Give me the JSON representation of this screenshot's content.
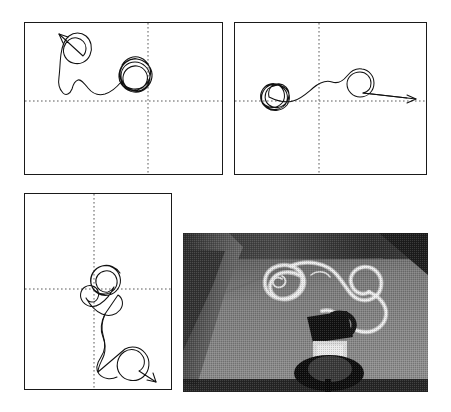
{
  "figure": {
    "background_color": "#ffffff",
    "width": 451,
    "height": 412,
    "panel_border_color": "#1a1a1a",
    "trace_color": "#111111",
    "axis_color": "#5a5a5a"
  },
  "panels": [
    {
      "id": "panel-top-left",
      "label": "",
      "x": 24,
      "y": 22,
      "width": 199,
      "height": 153,
      "origin_x": 0.625,
      "origin_y": 0.515,
      "axes_style": "dotted-crosshair",
      "trajectory": {
        "description": "looping path starting lower-right cluster of loops, exiting upper-left with arrow",
        "start_point": [
          0.63,
          0.53
        ],
        "end_point": [
          0.275,
          0.155
        ],
        "arrow_direction": "upper-left",
        "loop_count": 6,
        "path": "M 134 94 C 140 88 150 86 157 92 C 164 98 164 110 157 116 C 150 122 139 120 134 113 C 129 106 131 96 139 92 C 147 88 157 92 160 100 C 163 108 158 117 150 119 C 142 121 134 115 133 107 C 132 98 139 91 147 91 C 155 91 161 98 161 106 C 161 114 154 121 146 121 C 138 121 132 114 132 106 C 132 99 137 93 144 92 C 151 91 158 96 159 103 C 160 111 154 117 147 117 C 140 117 135 111 136 104 C 137 98 142 94 148 95 C 154 96 158 102 156 108 L 150 118 C 146 124 139 126 133 123 C 127 120 124 113 126 107 C 120 104 114 99 108 97 C 100 95 94 99 90 105 C 86 111 83 110 80 104 C 78 98 79 92 80 86 C 81 78 80 70 79 63 C 78 55 77 48 78 41 C 79 35 82 30 87 28 C 92 26 97 28 100 32 C 103 36 103 41 100 45 C 97 49 92 50 88 47 C 84 44 83 39 86 35 C 89 31 94 30 97 33 L 70 20"
      }
    },
    {
      "id": "panel-top-right",
      "label": "",
      "x": 234,
      "y": 22,
      "width": 193,
      "height": 153,
      "origin_x": 0.44,
      "origin_y": 0.515,
      "axes_style": "dotted-crosshair",
      "trajectory": {
        "description": "dense loop cluster near origin, path travels right ending in a circle with arrow pointing right",
        "start_point": [
          0.22,
          0.5
        ],
        "end_point": [
          0.99,
          0.51
        ],
        "arrow_direction": "right",
        "loop_count": 6,
        "path": "M 42 68 C 36 70 33 76 35 82 C 37 88 44 91 50 88 C 56 85 58 78 55 72 C 52 66 45 63 39 66 C 33 69 30 77 34 83 C 38 90 46 92 53 89 C 60 86 63 78 60 71 C 57 64 49 61 42 64 C 35 67 31 76 35 83 C 39 90 48 92 55 88 C 62 84 64 75 60 68 C 56 62 48 60 42 63 C 38 66 36 71 37 76 C 39 83 46 87 53 85 C 60 83 64 76 62 69 C 60 63 54 59 48 60 C 44 61 41 64 40 68 C 50 72 60 76 66 74 C 74 72 80 66 86 60 C 92 54 99 51 106 54 C 112 57 116 52 120 47 C 124 42 129 40 134 42 C 139 44 141 50 139 55 C 137 60 132 63 127 62 C 122 61 119 56 121 51 C 123 47 128 45 132 47 C 136 49 137 54 134 57 L 160 58"
      }
    },
    {
      "id": "panel-bottom-left",
      "label": "",
      "x": 24,
      "y": 193,
      "width": 148,
      "height": 197,
      "origin_x": 0.47,
      "origin_y": 0.4,
      "axes_style": "dotted-crosshair",
      "trajectory": {
        "description": "loop cluster at origin, path descends downward to a large circle with arrow pointing lower-right",
        "start_point": [
          0.75,
          0.36
        ],
        "end_point": [
          0.8,
          0.8
        ],
        "arrow_direction": "lower-right",
        "loop_count": 5,
        "path": "M 99 51 C 93 44 84 41 77 45 C 70 49 67 58 70 65 C 73 72 82 75 89 72 C 96 69 99 60 96 53 C 93 46 84 43 77 47 C 70 51 68 60 72 67 C 76 74 85 76 92 72 C 99 68 101 59 97 52 C 94 47 88 45 83 46 C 77 48 74 54 75 60 C 76 66 81 70 87 69 C 90 68 93 66 94 63 C 90 70 84 76 77 78 C 71 80 66 77 64 72 C 62 67 64 61 69 59 C 74 57 79 60 80 65 C 81 70 77 74 72 73 C 70 72 68 70 68 68 C 72 74 77 79 83 82 C 90 86 96 84 100 79 C 104 74 103 67 98 64 L 80 82 C 76 88 74 95 76 101 C 78 107 80 113 78 119 C 76 125 72 130 72 136 C 72 142 76 146 81 148 C 88 150 96 148 101 142 C 106 136 106 127 101 121 C 96 115 87 114 81 119 C 75 124 74 133 79 139 C 84 145 93 146 99 141 C 104 137 105 130 102 125 L 120 155"
      }
    }
  ],
  "photo": {
    "id": "long-exposure-photo",
    "x": 183,
    "y": 233,
    "width": 245,
    "height": 159,
    "description": "grainy halftone long-exposure photograph of a small wheeled robot on a dark floor with a bright looping light trail tracing its path",
    "tonal_range": "grayscale halftone, dark background, bright white light trail",
    "subject": "two-wheeled mobile robot with onboard circuit board and light source",
    "light_trail": "bright curling loop trail forming a spiral above the robot"
  }
}
